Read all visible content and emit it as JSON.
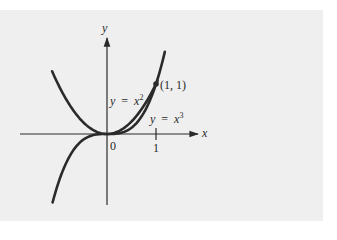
{
  "chart_data": {
    "type": "line",
    "title": "",
    "xlabel": "x",
    "ylabel": "y",
    "origin_label": "0",
    "x_ticks": [
      {
        "value": 1,
        "label": "1"
      }
    ],
    "xlim": [
      -1.12,
      1.2
    ],
    "ylim": [
      -1.4,
      1.6
    ],
    "grid": false,
    "legend": null,
    "series": [
      {
        "name": "y = x²",
        "label_var": "y",
        "label_eq": "=",
        "label_base": "x",
        "label_exp": "2",
        "function": "x^2",
        "domain": [
          -1.12,
          1.03
        ]
      },
      {
        "name": "y = x³",
        "label_var": "y",
        "label_eq": "=",
        "label_base": "x",
        "label_exp": "3",
        "function": "x^3",
        "domain": [
          -1.11,
          1.18
        ]
      }
    ],
    "annotations": [
      {
        "text": "(1, 1)",
        "x": 1,
        "y": 1,
        "marker": "filled-circle"
      }
    ]
  },
  "colors": {
    "panel": "#efefef",
    "ink": "#2a2a2a"
  }
}
